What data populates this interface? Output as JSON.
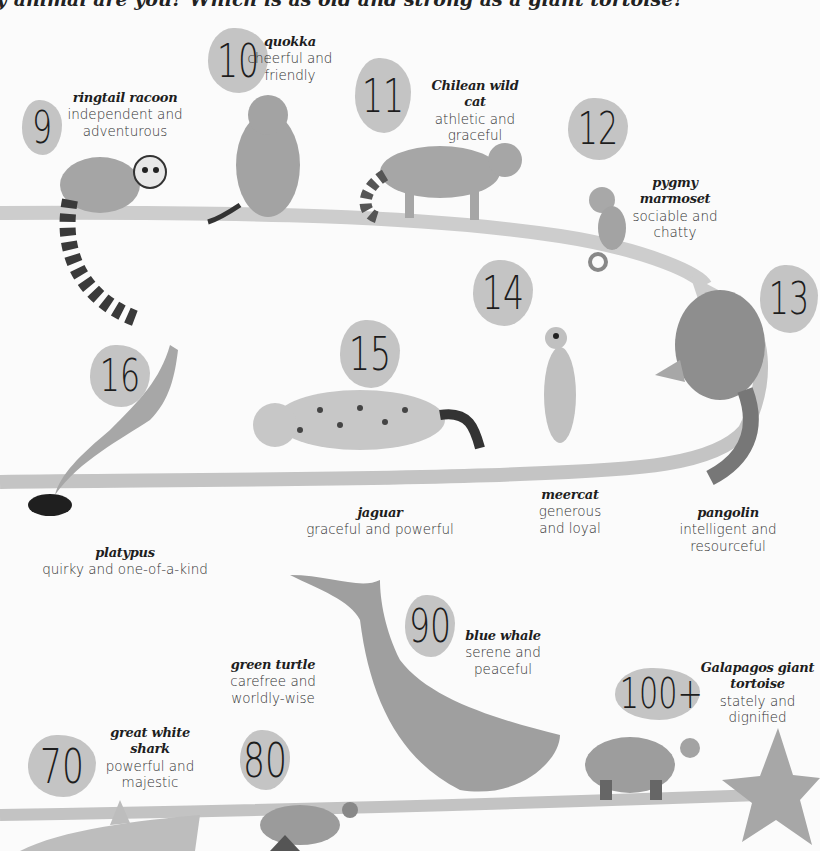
{
  "headline": "y animal are you? Which is as old and strong as a giant tortoise?",
  "colors": {
    "path": "#c9c9c9",
    "blob": "#c4c4c4",
    "animal_fill": "#a9a9a9",
    "animal_dark": "#3a3a3a",
    "star": "#a7a7a7"
  },
  "animals": [
    {
      "number": "9",
      "name": "ringtail racoon",
      "traits": [
        "independent and",
        "adventurous"
      ],
      "icon": "ringtail-racoon-icon"
    },
    {
      "number": "10",
      "name": "quokka",
      "traits": [
        "cheerful and",
        "friendly"
      ],
      "icon": "quokka-icon"
    },
    {
      "number": "11",
      "name": "Chilean wild cat",
      "traits": [
        "athletic and",
        "graceful"
      ],
      "icon": "wild-cat-icon"
    },
    {
      "number": "12",
      "name": "pygmy marmoset",
      "traits": [
        "sociable and",
        "chatty"
      ],
      "icon": "marmoset-icon"
    },
    {
      "number": "13",
      "name": "pangolin",
      "traits": [
        "intelligent and",
        "resourceful"
      ],
      "icon": "pangolin-icon"
    },
    {
      "number": "14",
      "name": "meercat",
      "traits": [
        "generous",
        "and loyal"
      ],
      "icon": "meerkat-icon"
    },
    {
      "number": "15",
      "name": "jaguar",
      "traits": [
        "graceful and powerful"
      ],
      "icon": "jaguar-icon"
    },
    {
      "number": "16",
      "name": "platypus",
      "traits": [
        "quirky and one-of-a-kind"
      ],
      "icon": "platypus-icon"
    },
    {
      "number": "70",
      "name": "great white shark",
      "name_lines": [
        "great white",
        "shark"
      ],
      "traits": [
        "powerful and",
        "majestic"
      ],
      "icon": "shark-icon"
    },
    {
      "number": "80",
      "name": "green turtle",
      "traits": [
        "carefree and",
        "worldly-wise"
      ],
      "icon": "sea-turtle-icon"
    },
    {
      "number": "90",
      "name": "blue whale",
      "traits": [
        "serene and",
        "peaceful"
      ],
      "icon": "whale-icon"
    },
    {
      "number": "100+",
      "name": "Galapagos giant tortoise",
      "name_lines": [
        "Galapagos giant",
        "tortoise"
      ],
      "traits": [
        "stately and",
        "dignified"
      ],
      "icon": "tortoise-icon"
    }
  ]
}
